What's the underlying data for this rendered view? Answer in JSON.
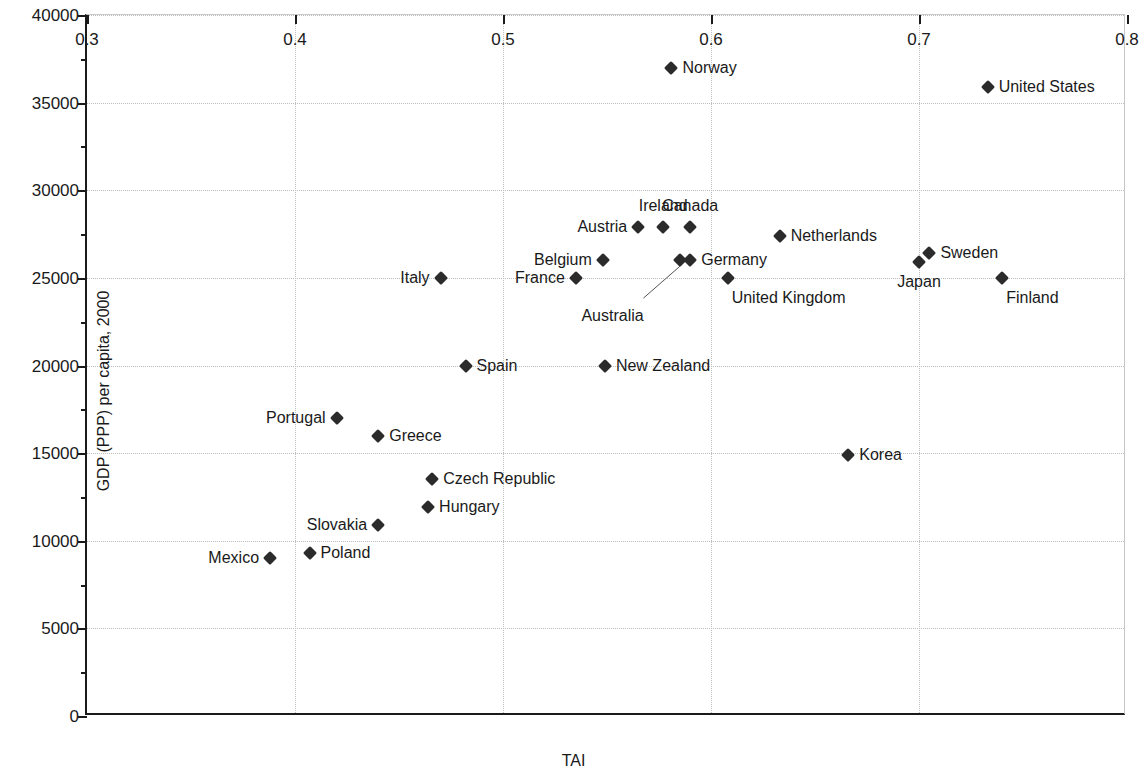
{
  "chart_data": {
    "type": "scatter",
    "title": "",
    "xlabel": "TAI",
    "ylabel": "GDP (PPP) per capita, 2000",
    "xlim": [
      0.3,
      0.8
    ],
    "ylim": [
      0,
      40000
    ],
    "xticks": [
      "0.3",
      "0.4",
      "0.5",
      "0.6",
      "0.7",
      "0.8"
    ],
    "xtick_values": [
      0.3,
      0.4,
      0.5,
      0.6,
      0.7,
      0.8
    ],
    "yticks": [
      "0",
      "5000",
      "10000",
      "15000",
      "20000",
      "25000",
      "30000",
      "35000",
      "40000"
    ],
    "ytick_values": [
      0,
      5000,
      10000,
      15000,
      20000,
      25000,
      30000,
      35000,
      40000
    ],
    "grid": "dotted-both",
    "legend": "none",
    "marker": "filled-diamond",
    "marker_color": "#2b2b2b",
    "points": [
      {
        "label": "Mexico",
        "x": 0.388,
        "y": 9000,
        "label_pos": "left"
      },
      {
        "label": "Poland",
        "x": 0.407,
        "y": 9300,
        "label_pos": "right"
      },
      {
        "label": "Slovakia",
        "x": 0.44,
        "y": 10900,
        "label_pos": "left"
      },
      {
        "label": "Hungary",
        "x": 0.464,
        "y": 11900,
        "label_pos": "right"
      },
      {
        "label": "Czech Republic",
        "x": 0.466,
        "y": 13500,
        "label_pos": "right"
      },
      {
        "label": "Korea",
        "x": 0.666,
        "y": 14900,
        "label_pos": "right"
      },
      {
        "label": "Greece",
        "x": 0.44,
        "y": 16000,
        "label_pos": "right"
      },
      {
        "label": "Portugal",
        "x": 0.42,
        "y": 17000,
        "label_pos": "left"
      },
      {
        "label": "Spain",
        "x": 0.482,
        "y": 20000,
        "label_pos": "right"
      },
      {
        "label": "New Zealand",
        "x": 0.549,
        "y": 20000,
        "label_pos": "right"
      },
      {
        "label": "Italy",
        "x": 0.47,
        "y": 25000,
        "label_pos": "left"
      },
      {
        "label": "France",
        "x": 0.535,
        "y": 25000,
        "label_pos": "left"
      },
      {
        "label": "United Kingdom",
        "x": 0.608,
        "y": 25000,
        "label_pos": "below-right"
      },
      {
        "label": "Finland",
        "x": 0.74,
        "y": 25000,
        "label_pos": "below-right"
      },
      {
        "label": "Japan",
        "x": 0.7,
        "y": 25900,
        "label_pos": "below"
      },
      {
        "label": "Belgium",
        "x": 0.548,
        "y": 26000,
        "label_pos": "left"
      },
      {
        "label": "Australia",
        "x": 0.585,
        "y": 26000,
        "label_pos": "leader"
      },
      {
        "label": "Germany",
        "x": 0.59,
        "y": 26000,
        "label_pos": "right"
      },
      {
        "label": "Sweden",
        "x": 0.705,
        "y": 26400,
        "label_pos": "right"
      },
      {
        "label": "Netherlands",
        "x": 0.633,
        "y": 27400,
        "label_pos": "right"
      },
      {
        "label": "Austria",
        "x": 0.565,
        "y": 27900,
        "label_pos": "left"
      },
      {
        "label": "Ireland",
        "x": 0.577,
        "y": 27900,
        "label_pos": "above"
      },
      {
        "label": "Canada",
        "x": 0.59,
        "y": 27900,
        "label_pos": "above"
      },
      {
        "label": "United States",
        "x": 0.733,
        "y": 35900,
        "label_pos": "right"
      },
      {
        "label": "Norway",
        "x": 0.581,
        "y": 37000,
        "label_pos": "right"
      }
    ],
    "annotations": [
      {
        "label": "Australia",
        "kind": "leader-line",
        "text_x": 0.555,
        "text_y": 23500,
        "target_x": 0.585,
        "target_y": 26000
      }
    ]
  }
}
